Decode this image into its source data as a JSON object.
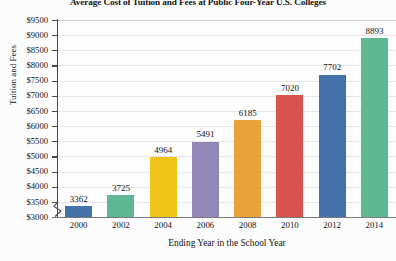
{
  "chart_data": {
    "type": "bar",
    "title": "Average Cost of Tuition and Fees at Public Four-Year U.S. Colleges",
    "xlabel": "Ending Year in the School Year",
    "ylabel": "Tuition and Fees",
    "categories": [
      "2000",
      "2002",
      "2004",
      "2006",
      "2008",
      "2010",
      "2012",
      "2014"
    ],
    "values": [
      3362,
      3725,
      4964,
      5491,
      6185,
      7020,
      7702,
      8893
    ],
    "value_labels": [
      "3362",
      "3725",
      "4964",
      "5491",
      "6185",
      "7020",
      "7702",
      "8893"
    ],
    "bar_colors": [
      "#4472A8",
      "#5FB894",
      "#F0C419",
      "#9188B8",
      "#E8A33D",
      "#D9534F",
      "#4472A8",
      "#5FB894"
    ],
    "ylim": [
      3000,
      9500
    ],
    "ytick_values": [
      9500,
      9000,
      8500,
      8000,
      7500,
      7000,
      6500,
      6000,
      5500,
      5000,
      4500,
      4000,
      3500,
      3000
    ],
    "ytick_labels": [
      "$9500",
      "$9000",
      "$8500",
      "$8000",
      "$7500",
      "$7000",
      "$6500",
      "$6000",
      "$5500",
      "$5000",
      "$4500",
      "$4000",
      "$3500",
      "$3000"
    ],
    "grid": true,
    "legend": "none",
    "y_axis_break": true
  }
}
